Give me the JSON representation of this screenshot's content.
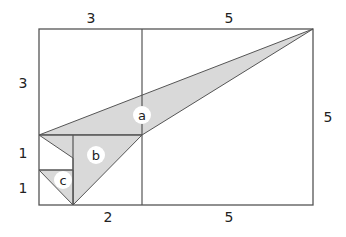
{
  "diagram": {
    "type": "geometry",
    "colors": {
      "stroke": "#555555",
      "fill": "#d9d9d9",
      "background": "#ffffff",
      "label_bg": "#ffffff"
    },
    "dimension_labels": {
      "top_left": "3",
      "top_right": "5",
      "left_upper": "3",
      "left_middle": "1",
      "left_lower": "1",
      "right": "5",
      "bottom_left": "2",
      "bottom_right": "5"
    },
    "triangles": [
      {
        "id": "a",
        "label": "a"
      },
      {
        "id": "b",
        "label": "b"
      },
      {
        "id": "c",
        "label": "c"
      }
    ]
  }
}
